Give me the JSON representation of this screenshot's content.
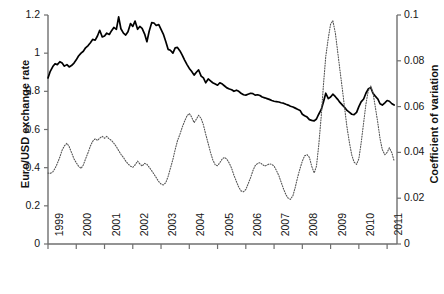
{
  "chart_data": {
    "type": "line",
    "title": "",
    "xlabel": "",
    "x_tick_labels": [
      "1999",
      "2000",
      "2001",
      "2002",
      "2003",
      "2004",
      "2005",
      "2006",
      "2007",
      "2008",
      "2009",
      "2010",
      "2011"
    ],
    "xlim": [
      1999,
      2011.35
    ],
    "grid": false,
    "legend": "none",
    "axes": [
      {
        "id": "left",
        "label": "Euro/USD exchange rate",
        "ticks": [
          "0",
          "0.2",
          "0.4",
          "0.6",
          "0.8",
          "1",
          "1.2"
        ],
        "tick_values": [
          0,
          0.2,
          0.4,
          0.6,
          0.8,
          1,
          1.2
        ],
        "lim": [
          0,
          1.2
        ]
      },
      {
        "id": "right",
        "label": "Coefficient of variation",
        "ticks": [
          "0",
          "0.02",
          "0.04",
          "0.06",
          "0.08",
          "0.1"
        ],
        "tick_values": [
          0,
          0.02,
          0.04,
          0.06,
          0.08,
          0.1
        ],
        "lim": [
          0,
          0.1
        ]
      }
    ],
    "series": [
      {
        "name": "Euro/USD exchange rate",
        "axis": "left",
        "style": "solid",
        "color": "#000000",
        "x": [
          1999.0,
          1999.08,
          1999.17,
          1999.25,
          1999.33,
          1999.42,
          1999.5,
          1999.58,
          1999.67,
          1999.75,
          1999.83,
          1999.92,
          2000.0,
          2000.08,
          2000.17,
          2000.25,
          2000.33,
          2000.42,
          2000.5,
          2000.58,
          2000.67,
          2000.75,
          2000.83,
          2000.92,
          2001.0,
          2001.08,
          2001.17,
          2001.25,
          2001.33,
          2001.42,
          2001.5,
          2001.58,
          2001.67,
          2001.75,
          2001.83,
          2001.92,
          2002.0,
          2002.08,
          2002.17,
          2002.25,
          2002.33,
          2002.42,
          2002.5,
          2002.58,
          2002.67,
          2002.75,
          2002.83,
          2002.92,
          2003.0,
          2003.08,
          2003.17,
          2003.25,
          2003.33,
          2003.42,
          2003.5,
          2003.58,
          2003.67,
          2003.75,
          2003.83,
          2003.92,
          2004.0,
          2004.08,
          2004.17,
          2004.25,
          2004.33,
          2004.42,
          2004.5,
          2004.58,
          2004.67,
          2004.75,
          2004.83,
          2004.92,
          2005.0,
          2005.08,
          2005.17,
          2005.25,
          2005.33,
          2005.42,
          2005.5,
          2005.58,
          2005.67,
          2005.75,
          2005.83,
          2005.92,
          2006.0,
          2006.08,
          2006.17,
          2006.25,
          2006.33,
          2006.42,
          2006.5,
          2006.58,
          2006.67,
          2006.75,
          2006.83,
          2006.92,
          2007.0,
          2007.08,
          2007.17,
          2007.25,
          2007.33,
          2007.42,
          2007.5,
          2007.58,
          2007.67,
          2007.75,
          2007.83,
          2007.92,
          2008.0,
          2008.08,
          2008.17,
          2008.25,
          2008.33,
          2008.42,
          2008.5,
          2008.58,
          2008.67,
          2008.75,
          2008.83,
          2008.92,
          2009.0,
          2009.08,
          2009.17,
          2009.25,
          2009.33,
          2009.42,
          2009.5,
          2009.58,
          2009.67,
          2009.75,
          2009.83,
          2009.92,
          2010.0,
          2010.08,
          2010.17,
          2010.25,
          2010.33,
          2010.42,
          2010.5,
          2010.58,
          2010.67,
          2010.75,
          2010.83,
          2010.92,
          2011.0,
          2011.08,
          2011.17,
          2011.25
        ],
        "y": [
          0.87,
          0.905,
          0.93,
          0.945,
          0.94,
          0.955,
          0.948,
          0.932,
          0.94,
          0.928,
          0.935,
          0.948,
          0.965,
          0.985,
          1.0,
          1.01,
          1.028,
          1.04,
          1.055,
          1.072,
          1.068,
          1.09,
          1.12,
          1.085,
          1.09,
          1.105,
          1.098,
          1.118,
          1.135,
          1.125,
          1.19,
          1.128,
          1.105,
          1.095,
          1.112,
          1.155,
          1.14,
          1.168,
          1.125,
          1.14,
          1.13,
          1.1,
          1.06,
          1.115,
          1.16,
          1.158,
          1.145,
          1.15,
          1.125,
          1.1,
          1.06,
          1.02,
          1.015,
          1.0,
          1.028,
          1.03,
          1.012,
          0.99,
          0.965,
          0.94,
          0.92,
          0.905,
          0.885,
          0.9,
          0.912,
          0.88,
          0.87,
          0.845,
          0.865,
          0.855,
          0.845,
          0.838,
          0.832,
          0.845,
          0.838,
          0.828,
          0.818,
          0.812,
          0.808,
          0.8,
          0.806,
          0.8,
          0.79,
          0.782,
          0.78,
          0.785,
          0.79,
          0.788,
          0.78,
          0.782,
          0.778,
          0.77,
          0.766,
          0.762,
          0.758,
          0.752,
          0.748,
          0.746,
          0.744,
          0.74,
          0.738,
          0.732,
          0.728,
          0.722,
          0.718,
          0.712,
          0.706,
          0.7,
          0.68,
          0.672,
          0.665,
          0.652,
          0.648,
          0.645,
          0.655,
          0.68,
          0.705,
          0.745,
          0.79,
          0.762,
          0.77,
          0.785,
          0.772,
          0.758,
          0.742,
          0.728,
          0.715,
          0.7,
          0.69,
          0.68,
          0.678,
          0.69,
          0.72,
          0.745,
          0.76,
          0.79,
          0.812,
          0.82,
          0.79,
          0.775,
          0.76,
          0.735,
          0.728,
          0.74,
          0.752,
          0.748,
          0.735,
          0.728
        ]
      },
      {
        "name": "Coefficient of variation",
        "axis": "right",
        "style": "dotted",
        "color": "#555555",
        "x": [
          1999.0,
          1999.08,
          1999.17,
          1999.25,
          1999.33,
          1999.42,
          1999.5,
          1999.58,
          1999.67,
          1999.75,
          1999.83,
          1999.92,
          2000.0,
          2000.08,
          2000.17,
          2000.25,
          2000.33,
          2000.42,
          2000.5,
          2000.58,
          2000.67,
          2000.75,
          2000.83,
          2000.92,
          2001.0,
          2001.08,
          2001.17,
          2001.25,
          2001.33,
          2001.42,
          2001.5,
          2001.58,
          2001.67,
          2001.75,
          2001.83,
          2001.92,
          2002.0,
          2002.08,
          2002.17,
          2002.25,
          2002.33,
          2002.42,
          2002.5,
          2002.58,
          2002.67,
          2002.75,
          2002.83,
          2002.92,
          2003.0,
          2003.08,
          2003.17,
          2003.25,
          2003.33,
          2003.42,
          2003.5,
          2003.58,
          2003.67,
          2003.75,
          2003.83,
          2003.92,
          2004.0,
          2004.08,
          2004.17,
          2004.25,
          2004.33,
          2004.42,
          2004.5,
          2004.58,
          2004.67,
          2004.75,
          2004.83,
          2004.92,
          2005.0,
          2005.08,
          2005.17,
          2005.25,
          2005.33,
          2005.42,
          2005.5,
          2005.58,
          2005.67,
          2005.75,
          2005.83,
          2005.92,
          2006.0,
          2006.08,
          2006.17,
          2006.25,
          2006.33,
          2006.42,
          2006.5,
          2006.58,
          2006.67,
          2006.75,
          2006.83,
          2006.92,
          2007.0,
          2007.08,
          2007.17,
          2007.25,
          2007.33,
          2007.42,
          2007.5,
          2007.58,
          2007.67,
          2007.75,
          2007.83,
          2007.92,
          2008.0,
          2008.08,
          2008.17,
          2008.25,
          2008.33,
          2008.42,
          2008.5,
          2008.58,
          2008.67,
          2008.75,
          2008.83,
          2008.92,
          2009.0,
          2009.08,
          2009.17,
          2009.25,
          2009.33,
          2009.42,
          2009.5,
          2009.58,
          2009.67,
          2009.75,
          2009.83,
          2009.92,
          2010.0,
          2010.08,
          2010.17,
          2010.25,
          2010.33,
          2010.42,
          2010.5,
          2010.58,
          2010.67,
          2010.75,
          2010.83,
          2010.92,
          2011.0,
          2011.08,
          2011.17,
          2011.25
        ],
        "y": [
          0.031,
          0.0308,
          0.0315,
          0.033,
          0.0352,
          0.038,
          0.041,
          0.0428,
          0.044,
          0.0425,
          0.04,
          0.0372,
          0.0355,
          0.034,
          0.033,
          0.0345,
          0.0372,
          0.04,
          0.0428,
          0.0448,
          0.046,
          0.0452,
          0.0462,
          0.047,
          0.0462,
          0.047,
          0.0458,
          0.0452,
          0.044,
          0.0425,
          0.0408,
          0.0392,
          0.0378,
          0.0362,
          0.035,
          0.034,
          0.0335,
          0.0345,
          0.0362,
          0.035,
          0.034,
          0.0352,
          0.0348,
          0.0335,
          0.032,
          0.0305,
          0.029,
          0.0272,
          0.0262,
          0.0258,
          0.0268,
          0.0295,
          0.033,
          0.037,
          0.0412,
          0.045,
          0.048,
          0.051,
          0.0535,
          0.056,
          0.057,
          0.0555,
          0.053,
          0.0545,
          0.0562,
          0.0548,
          0.052,
          0.048,
          0.0438,
          0.04,
          0.0368,
          0.0345,
          0.0342,
          0.0355,
          0.0372,
          0.0378,
          0.037,
          0.0352,
          0.033,
          0.03,
          0.0272,
          0.0248,
          0.0232,
          0.0228,
          0.0238,
          0.0262,
          0.029,
          0.032,
          0.0342,
          0.0352,
          0.0355,
          0.0348,
          0.034,
          0.0345,
          0.035,
          0.0348,
          0.034,
          0.0322,
          0.0298,
          0.027,
          0.0242,
          0.0215,
          0.02,
          0.0195,
          0.0212,
          0.0248,
          0.029,
          0.033,
          0.0362,
          0.0385,
          0.039,
          0.0378,
          0.034,
          0.031,
          0.034,
          0.043,
          0.056,
          0.07,
          0.082,
          0.09,
          0.096,
          0.0975,
          0.092,
          0.084,
          0.076,
          0.0672,
          0.059,
          0.051,
          0.044,
          0.0388,
          0.0358,
          0.0348,
          0.0372,
          0.044,
          0.053,
          0.061,
          0.0668,
          0.069,
          0.066,
          0.06,
          0.053,
          0.046,
          0.0412,
          0.039,
          0.04,
          0.042,
          0.0398,
          0.0362
        ]
      }
    ]
  }
}
